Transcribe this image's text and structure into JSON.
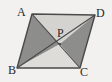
{
  "figure": {
    "shape_type": "parallelogram",
    "background_color": "#f2f1ef",
    "outline_color": "#4a4a4a",
    "label_color": "#2b2b2b",
    "vertices": [
      {
        "name": "A",
        "label": "A",
        "x": 32,
        "y": 14
      },
      {
        "name": "D",
        "label": "D",
        "x": 95,
        "y": 15
      },
      {
        "name": "C",
        "label": "C",
        "x": 80,
        "y": 68
      },
      {
        "name": "B",
        "label": "B",
        "x": 17,
        "y": 68
      }
    ],
    "intersection": {
      "name": "P",
      "label": "P",
      "x": 60,
      "y": 44
    },
    "diagonals": [
      {
        "name": "diagonal-AC",
        "from": "A",
        "to": "C"
      },
      {
        "name": "diagonal-BD",
        "from": "B",
        "to": "D"
      }
    ],
    "regions": [
      {
        "name": "triangle-APD",
        "label": "APD",
        "fill": "#d4d3d0",
        "points": "32,14 95,15 60,44"
      },
      {
        "name": "triangle-ABP",
        "label": "ABP",
        "fill": "#8d8d8b",
        "points": "32,14 17,68 60,44"
      },
      {
        "name": "triangle-BPC",
        "label": "BPC",
        "fill": "#dddcd9",
        "points": "17,68 80,68 60,44"
      },
      {
        "name": "triangle-PCD",
        "label": "PCD",
        "fill": "#8d8d8b",
        "points": "80,68 95,15 60,44"
      }
    ]
  }
}
